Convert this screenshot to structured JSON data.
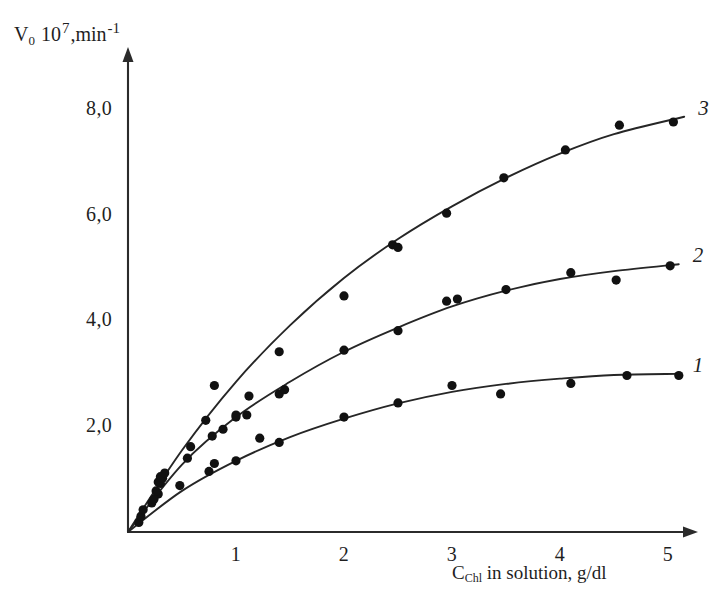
{
  "figure": {
    "background_color": "#ffffff",
    "ink_color": "#1f1f1f",
    "width": 710,
    "height": 606
  },
  "axes": {
    "y_title_parts": {
      "symbol": "V",
      "subscript": "0",
      "factor_base": "10",
      "factor_exponent": "7",
      "comma": ",",
      "unit": "min",
      "unit_exponent": "-1"
    },
    "x_title_parts": {
      "symbol": "C",
      "subscript": "Chl",
      "rest": " in solution, g/dl"
    },
    "y_ticks": [
      "2,0",
      "4,0",
      "6,0",
      "8,0"
    ],
    "x_ticks": [
      "1",
      "2",
      "3",
      "4",
      "5"
    ],
    "arrow_ends": true
  },
  "chart_data": {
    "type": "scatter",
    "title": "",
    "xlabel": "C_Chl in solution, g/dl",
    "ylabel": "V0 10^7, min^-1",
    "xlim": [
      0,
      5.5
    ],
    "ylim": [
      0,
      8.6
    ],
    "xticks": [
      1,
      2,
      3,
      4,
      5
    ],
    "yticks": [
      2.0,
      4.0,
      6.0,
      8.0
    ],
    "grid": false,
    "legend": "curve-end labels",
    "decimal_separator": ",",
    "series": [
      {
        "name": "1",
        "label": "1",
        "label_position": "right-end",
        "marker": "filled-circle",
        "points": [
          [
            0.1,
            0.18
          ],
          [
            0.22,
            0.55
          ],
          [
            0.28,
            0.72
          ],
          [
            0.3,
            0.92
          ],
          [
            0.48,
            0.88
          ],
          [
            0.75,
            1.15
          ],
          [
            0.8,
            1.3
          ],
          [
            1.0,
            1.35
          ],
          [
            1.22,
            1.78
          ],
          [
            1.4,
            1.7
          ],
          [
            2.0,
            2.18
          ],
          [
            2.5,
            2.45
          ],
          [
            3.0,
            2.78
          ],
          [
            3.45,
            2.62
          ],
          [
            4.1,
            2.82
          ],
          [
            4.62,
            2.97
          ],
          [
            5.1,
            2.97
          ]
        ],
        "fit_curve": [
          [
            0.0,
            0.0
          ],
          [
            0.5,
            0.78
          ],
          [
            1.0,
            1.35
          ],
          [
            1.5,
            1.8
          ],
          [
            2.0,
            2.15
          ],
          [
            2.5,
            2.44
          ],
          [
            3.0,
            2.66
          ],
          [
            3.5,
            2.81
          ],
          [
            4.0,
            2.91
          ],
          [
            4.5,
            2.98
          ],
          [
            5.1,
            3.0
          ]
        ]
      },
      {
        "name": "2",
        "label": "2",
        "label_position": "right-end",
        "marker": "filled-circle",
        "points": [
          [
            0.12,
            0.3
          ],
          [
            0.24,
            0.62
          ],
          [
            0.28,
            0.95
          ],
          [
            0.32,
            1.02
          ],
          [
            0.55,
            1.4
          ],
          [
            0.78,
            1.82
          ],
          [
            0.88,
            1.95
          ],
          [
            1.0,
            2.18
          ],
          [
            1.1,
            2.22
          ],
          [
            1.4,
            2.62
          ],
          [
            1.45,
            2.7
          ],
          [
            2.0,
            3.45
          ],
          [
            2.5,
            3.82
          ],
          [
            2.95,
            4.38
          ],
          [
            3.05,
            4.42
          ],
          [
            3.5,
            4.6
          ],
          [
            4.1,
            4.92
          ],
          [
            4.52,
            4.78
          ],
          [
            5.02,
            5.05
          ]
        ],
        "fit_curve": [
          [
            0.0,
            0.0
          ],
          [
            0.5,
            1.28
          ],
          [
            1.0,
            2.18
          ],
          [
            1.5,
            2.85
          ],
          [
            2.0,
            3.42
          ],
          [
            2.5,
            3.88
          ],
          [
            3.0,
            4.28
          ],
          [
            3.5,
            4.58
          ],
          [
            4.0,
            4.8
          ],
          [
            4.5,
            4.95
          ],
          [
            5.1,
            5.08
          ]
        ]
      },
      {
        "name": "3",
        "label": "3",
        "label_position": "right-end",
        "marker": "filled-circle",
        "points": [
          [
            0.14,
            0.42
          ],
          [
            0.26,
            0.78
          ],
          [
            0.3,
            1.05
          ],
          [
            0.34,
            1.12
          ],
          [
            0.58,
            1.62
          ],
          [
            0.72,
            2.12
          ],
          [
            0.8,
            2.78
          ],
          [
            1.0,
            2.22
          ],
          [
            1.12,
            2.58
          ],
          [
            1.4,
            3.42
          ],
          [
            2.0,
            4.48
          ],
          [
            2.45,
            5.45
          ],
          [
            2.5,
            5.4
          ],
          [
            2.95,
            6.05
          ],
          [
            3.48,
            6.72
          ],
          [
            4.05,
            7.25
          ],
          [
            4.55,
            7.72
          ],
          [
            5.05,
            7.78
          ]
        ],
        "fit_curve": [
          [
            0.0,
            0.0
          ],
          [
            0.5,
            1.55
          ],
          [
            1.0,
            2.85
          ],
          [
            1.5,
            3.92
          ],
          [
            2.0,
            4.82
          ],
          [
            2.5,
            5.56
          ],
          [
            3.0,
            6.18
          ],
          [
            3.5,
            6.72
          ],
          [
            4.0,
            7.18
          ],
          [
            4.5,
            7.55
          ],
          [
            5.15,
            7.88
          ]
        ]
      }
    ]
  }
}
